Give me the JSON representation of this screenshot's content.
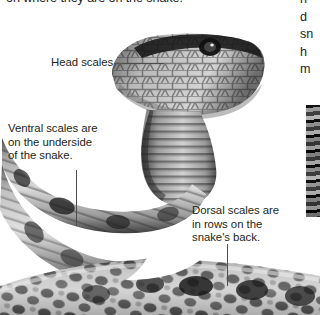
{
  "page": {
    "background_color": "#ffffff",
    "text_color": "#231f20",
    "width": 320,
    "height": 315
  },
  "intro": {
    "clipped_line": "on where they are on the snake."
  },
  "right_column": {
    "clipped_lines": "n\nd\nsn\nh\nm"
  },
  "labels": {
    "head_scales": "Head scales",
    "ventral_scales": "Ventral scales are\non the underside\nof the snake.",
    "dorsal_scales": "Dorsal scales are\nin rows on the\nsnake's back."
  },
  "figure": {
    "leader_lines": [
      {
        "name": "head-scales-leader",
        "orientation": "horizontal"
      },
      {
        "name": "ventral-scales-leader",
        "orientation": "vertical"
      },
      {
        "name": "dorsal-scales-leader",
        "orientation": "vertical"
      }
    ]
  },
  "right_photo": {
    "name": "secondary-photo-strip",
    "description": "clipped grayscale photograph at right page edge"
  }
}
